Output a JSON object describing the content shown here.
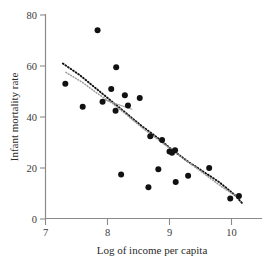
{
  "chart_data": {
    "type": "scatter",
    "title": "",
    "xlabel": "Log of income per capita",
    "ylabel": "Infant mortality rate",
    "xlim": [
      7,
      10.4
    ],
    "ylim": [
      0,
      80
    ],
    "xticks": [
      7,
      8,
      9,
      10
    ],
    "xtick_labels": [
      "7",
      "8",
      "9",
      "10"
    ],
    "yticks": [
      0,
      20,
      40,
      60,
      80
    ],
    "ytick_labels": [
      "0",
      "20",
      "40",
      "60",
      "80"
    ],
    "grid": false,
    "legend": "none",
    "point_color": "#111111",
    "axis_color": "#8a8a8a",
    "points": [
      {
        "x": 7.32,
        "y": 53.0
      },
      {
        "x": 7.6,
        "y": 44.0
      },
      {
        "x": 7.84,
        "y": 74.0
      },
      {
        "x": 7.92,
        "y": 46.0
      },
      {
        "x": 8.06,
        "y": 51.0
      },
      {
        "x": 8.14,
        "y": 59.5
      },
      {
        "x": 8.13,
        "y": 42.5
      },
      {
        "x": 8.22,
        "y": 17.5
      },
      {
        "x": 8.28,
        "y": 48.5
      },
      {
        "x": 8.33,
        "y": 44.5
      },
      {
        "x": 8.52,
        "y": 47.5
      },
      {
        "x": 8.66,
        "y": 12.5
      },
      {
        "x": 8.69,
        "y": 32.5
      },
      {
        "x": 8.82,
        "y": 19.5
      },
      {
        "x": 8.88,
        "y": 31.0
      },
      {
        "x": 9.0,
        "y": 26.5
      },
      {
        "x": 9.04,
        "y": 26.0
      },
      {
        "x": 9.09,
        "y": 27.0
      },
      {
        "x": 9.1,
        "y": 14.5
      },
      {
        "x": 9.3,
        "y": 17.0
      },
      {
        "x": 9.64,
        "y": 20.0
      },
      {
        "x": 9.98,
        "y": 8.0
      },
      {
        "x": 10.12,
        "y": 9.0
      }
    ],
    "series": [
      {
        "name": "dashed-fit",
        "style": "dashed",
        "color": "#101010",
        "x": [
          7.28,
          7.55,
          7.8,
          8.05,
          8.3,
          8.55,
          8.8,
          9.05,
          9.3,
          9.55,
          9.8,
          10.05,
          10.18
        ],
        "y": [
          61.0,
          56.5,
          51.5,
          46.5,
          41.5,
          36.5,
          32.0,
          27.0,
          22.5,
          18.5,
          14.5,
          9.5,
          6.0
        ]
      },
      {
        "name": "dotted-fit",
        "style": "dotted",
        "color": "#9a9a9a",
        "x": [
          7.33,
          7.6,
          7.85,
          8.1,
          8.35,
          8.6,
          8.85,
          9.1,
          9.35,
          9.6,
          9.85,
          10.1
        ],
        "y": [
          57.5,
          53.5,
          49.0,
          45.0,
          40.0,
          35.0,
          30.5,
          26.0,
          21.5,
          17.0,
          12.5,
          8.5
        ]
      },
      {
        "name": "straight-segment",
        "style": "solid",
        "color": "#9c9c9c",
        "x": [
          7.92,
          8.4
        ],
        "y": [
          47.0,
          43.0
        ]
      }
    ]
  },
  "axes": {
    "x_title": "Log of income per capita",
    "y_title": "Infant mortality rate"
  }
}
